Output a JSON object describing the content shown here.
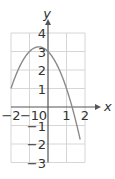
{
  "chart_data": {
    "type": "line",
    "title": "",
    "xlabel": "x",
    "ylabel": "y",
    "xlim": [
      -2,
      2
    ],
    "ylim": [
      -3,
      4
    ],
    "grid": true,
    "legend": null,
    "x_ticks": [
      "-2",
      "-1",
      "0",
      "1",
      "2"
    ],
    "y_ticks": [
      "4",
      "3",
      "2",
      "1",
      "-1",
      "-2",
      "-3"
    ],
    "series": [
      {
        "name": "parabola",
        "equation_estimate": "y = -x^2 - x + 3",
        "x": [
          -2.0,
          -1.5,
          -1.0,
          -0.5,
          0.0,
          0.5,
          1.0,
          1.3,
          1.5,
          1.75
        ],
        "y": [
          1.0,
          2.25,
          3.0,
          3.25,
          3.0,
          2.25,
          1.0,
          0.0,
          -0.75,
          -3.0
        ]
      }
    ],
    "colors": {
      "curve": "#8a8a8a",
      "axes": "#555555",
      "grid": "#d6d6d6",
      "text": "#333333"
    }
  }
}
